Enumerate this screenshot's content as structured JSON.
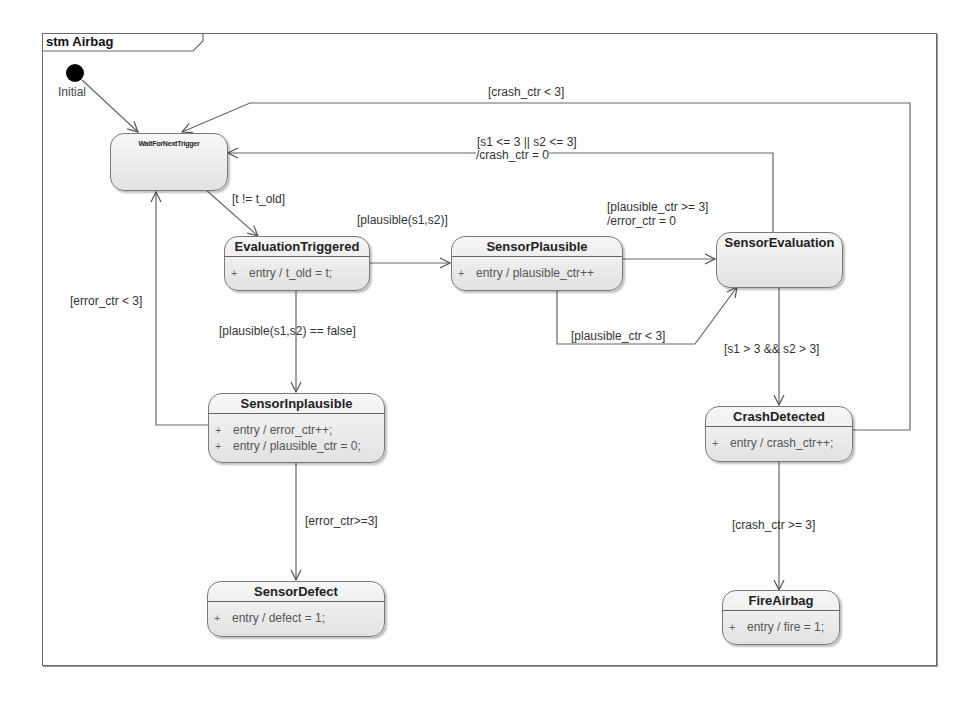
{
  "diagram": {
    "kind": "stm",
    "name": "Airbag",
    "frame_label": "stm Airbag"
  },
  "initial": {
    "label": "Initial"
  },
  "states": {
    "wait": {
      "name": "WaitForNextTrigger",
      "activities": []
    },
    "evaluation_triggered": {
      "name": "EvaluationTriggered",
      "activities": [
        {
          "marker": "+",
          "text": "entry / t_old = t;"
        }
      ]
    },
    "sensor_plausible": {
      "name": "SensorPlausible",
      "activities": [
        {
          "marker": "+",
          "text": "entry / plausible_ctr++"
        }
      ]
    },
    "sensor_evaluation": {
      "name": "SensorEvaluation",
      "activities": []
    },
    "sensor_inplausible": {
      "name": "SensorInplausible",
      "activities": [
        {
          "marker": "+",
          "text": "entry / error_ctr++;"
        },
        {
          "marker": "+",
          "text": "entry / plausible_ctr = 0;"
        }
      ]
    },
    "crash_detected": {
      "name": "CrashDetected",
      "activities": [
        {
          "marker": "+",
          "text": "entry / crash_ctr++;"
        }
      ]
    },
    "sensor_defect": {
      "name": "SensorDefect",
      "activities": [
        {
          "marker": "+",
          "text": "entry / defect = 1;"
        }
      ]
    },
    "fire_airbag": {
      "name": "FireAirbag",
      "activities": [
        {
          "marker": "+",
          "text": "entry / fire = 1;"
        }
      ]
    }
  },
  "transitions": {
    "t_changed": "[t != t_old]",
    "plausible": "[plausible(s1,s2)]",
    "plausible_ge3": "[plausible_ctr >= 3]",
    "plausible_ge3_effect": "/error_ctr = 0",
    "s_low": "[s1 <= 3 || s2 <= 3]",
    "s_low_effect": "/crash_ctr = 0",
    "crash_lt3": "[crash_ctr < 3]",
    "error_lt3": "[error_ctr < 3]",
    "not_plausible": "[plausible(s1,s2) == false]",
    "plausible_lt3": "[plausible_ctr < 3]",
    "s_high": "[s1 > 3 && s2 > 3]",
    "error_ge3": "[error_ctr>=3]",
    "crash_ge3": "[crash_ctr >= 3]"
  }
}
